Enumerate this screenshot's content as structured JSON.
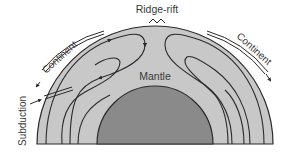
{
  "diagram": {
    "type": "mantle-convection-cross-section",
    "labels": {
      "ridge": "Ridge-rift",
      "continent_left": "Continent",
      "continent_right": "Continent",
      "mantle": "Mantle",
      "subduction": "Subduction"
    },
    "colors": {
      "background": "#ffffff",
      "mantle": "#c8c8c8",
      "core": "#8a8a8a",
      "lines": "#2a2a2a",
      "text": "#3a3a3a"
    }
  }
}
